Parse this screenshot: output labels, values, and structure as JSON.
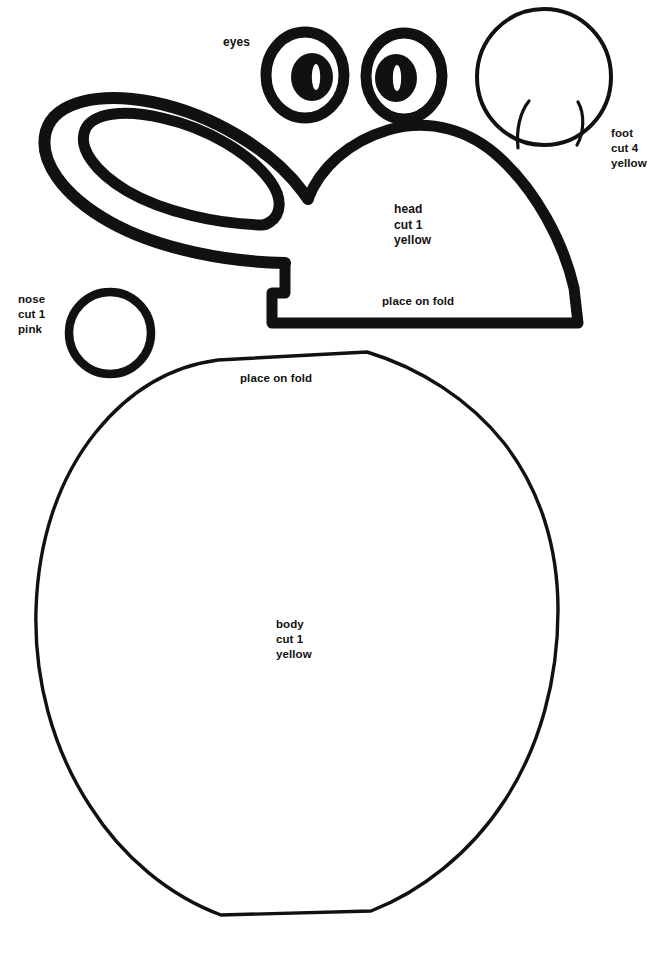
{
  "document": {
    "kind": "craft-pattern-template",
    "subject": "bunny",
    "background_color": "#ffffff",
    "ink_color": "#111111",
    "width": 669,
    "height": 956
  },
  "labels": {
    "eyes": "eyes",
    "foot": "foot\ncut 4\nyellow",
    "head": "head\ncut 1\nyellow",
    "nose": "nose\ncut 1\npink",
    "place_on_fold_head": "place on fold",
    "place_on_fold_body": "place on fold",
    "body": "body\ncut 1\nyellow"
  },
  "pieces": [
    {
      "name": "eyes",
      "label": "eyes",
      "cut_count": 2,
      "color": "",
      "shape": "two-rings-with-pupils"
    },
    {
      "name": "ear",
      "label": "",
      "cut_count": 0,
      "color": "",
      "shape": "long-tilted-double-oval"
    },
    {
      "name": "head",
      "label": "head",
      "cut_count": 1,
      "color": "yellow",
      "shape": "dome-on-fold",
      "fold_note": "place on fold"
    },
    {
      "name": "foot",
      "label": "foot",
      "cut_count": 4,
      "color": "yellow",
      "shape": "circle-with-toe-lines"
    },
    {
      "name": "nose",
      "label": "nose",
      "cut_count": 1,
      "color": "pink",
      "shape": "circle"
    },
    {
      "name": "body",
      "label": "body",
      "cut_count": 1,
      "color": "yellow",
      "shape": "rounded-polygon-on-fold",
      "fold_note": "place on fold"
    }
  ]
}
